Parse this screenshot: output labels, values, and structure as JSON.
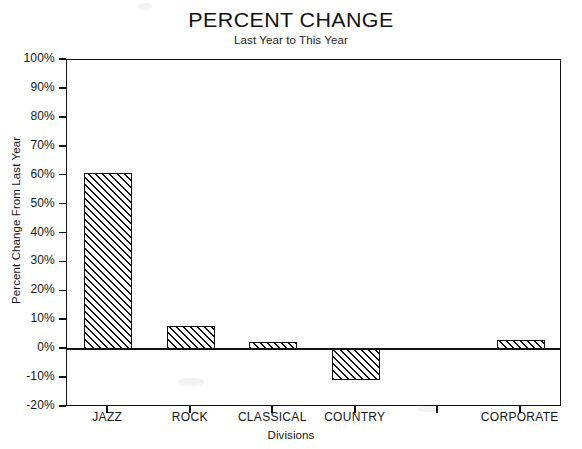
{
  "chart_data": {
    "type": "bar",
    "title": "PERCENT CHANGE",
    "subtitle": "Last Year to This Year",
    "xlabel": "Divisions",
    "ylabel": "Percent Change From Last Year",
    "categories": [
      "JAZZ",
      "ROCK",
      "CLASSICAL",
      "COUNTRY",
      "",
      "CORPORATE"
    ],
    "values": [
      61,
      8,
      2.5,
      -10.5,
      null,
      3
    ],
    "value_labels": [
      "61%",
      "8%",
      "2.5%",
      "-10.5%",
      "",
      "3%"
    ],
    "ylim": [
      -20,
      100
    ],
    "ytick_values": [
      100,
      90,
      80,
      70,
      60,
      50,
      40,
      30,
      20,
      10,
      0,
      -10,
      -20
    ],
    "ytick_labels": [
      "100%",
      "90%",
      "80%",
      "70%",
      "60%",
      "50%",
      "40%",
      "30%",
      "20%",
      "10%",
      "0%",
      "-10%",
      "-20%"
    ],
    "grid": false,
    "legend": false,
    "bar_fill": "diagonal-hatch",
    "bar_color": "#111111",
    "background": "#ffffff"
  },
  "axes": {
    "y_title": "Percent Change From Last Year",
    "x_title": "Divisions"
  },
  "header": {
    "title": "PERCENT CHANGE",
    "subtitle": "Last Year to This Year"
  }
}
